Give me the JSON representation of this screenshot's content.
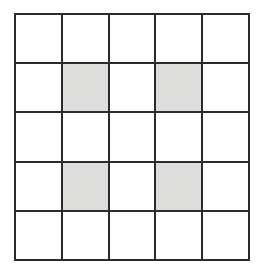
{
  "figure": {
    "title": "",
    "type": "grid",
    "rows": 5,
    "columns": 5,
    "colors": {
      "background": "#ffffff",
      "grid_line": "#2b2b2b",
      "cell_empty": "#ffffff",
      "cell_shaded": "#dddddb"
    },
    "shaded_cells": [
      {
        "row": 2,
        "column": 2
      },
      {
        "row": 2,
        "column": 4
      },
      {
        "row": 4,
        "column": 2
      },
      {
        "row": 4,
        "column": 4
      }
    ],
    "shaded_count": 4,
    "total_cells": 25
  },
  "chart_data": {
    "type": "heatmap",
    "title": "",
    "xlabel": "",
    "ylabel": "",
    "categories_x": [
      "1",
      "2",
      "3",
      "4",
      "5"
    ],
    "categories_y": [
      "1",
      "2",
      "3",
      "4",
      "5"
    ],
    "legend": [],
    "grid": true,
    "values": [
      [
        0,
        0,
        0,
        0,
        0
      ],
      [
        0,
        1,
        0,
        1,
        0
      ],
      [
        0,
        0,
        0,
        0,
        0
      ],
      [
        0,
        1,
        0,
        1,
        0
      ],
      [
        0,
        0,
        0,
        0,
        0
      ]
    ]
  }
}
